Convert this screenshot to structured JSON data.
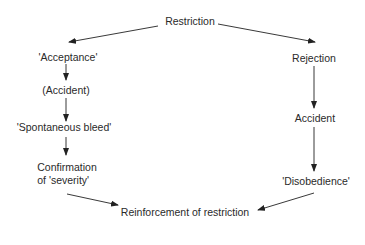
{
  "diagram": {
    "colors": {
      "text": "#2a2a2a",
      "line": "#222222",
      "background": "#ffffff"
    },
    "nodes": {
      "restriction": "Restriction",
      "acceptance": "'Acceptance'",
      "accident_paren": "(Accident)",
      "spontaneous_bleed": "'Spontaneous bleed'",
      "confirmation_line1": "Confirmation",
      "confirmation_line2": "of 'severity'",
      "rejection": "Rejection",
      "accident": "Accident",
      "disobedience": "'Disobedience'",
      "reinforcement": "Reinforcement of restriction"
    },
    "edges": [
      {
        "from": "Restriction",
        "to": "'Acceptance'"
      },
      {
        "from": "Restriction",
        "to": "Rejection"
      },
      {
        "from": "'Acceptance'",
        "to": "(Accident)"
      },
      {
        "from": "(Accident)",
        "to": "'Spontaneous bleed'"
      },
      {
        "from": "'Spontaneous bleed'",
        "to": "Confirmation of 'severity'"
      },
      {
        "from": "Confirmation of 'severity'",
        "to": "Reinforcement of restriction"
      },
      {
        "from": "Rejection",
        "to": "Accident"
      },
      {
        "from": "Accident",
        "to": "'Disobedience'"
      },
      {
        "from": "'Disobedience'",
        "to": "Reinforcement of restriction"
      }
    ]
  }
}
